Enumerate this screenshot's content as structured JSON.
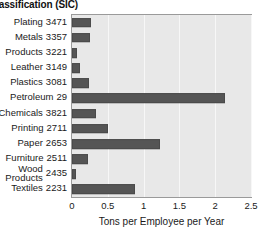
{
  "chart_data": {
    "type": "bar",
    "orientation": "horizontal",
    "title": "lassification (SIC)",
    "xlabel": "Tons per Employee per Year",
    "ylabel": "",
    "xlim": [
      0,
      2.5
    ],
    "xticks": [
      "0",
      "0.5",
      "1",
      "1.5",
      "2",
      "2.5"
    ],
    "xtick_values": [
      0,
      0.5,
      1,
      1.5,
      2,
      2.5
    ],
    "grid": true,
    "legend": "none",
    "bar_color": "#555555",
    "plot_background": "#e8e8e8",
    "categories": [
      "Plating 3471",
      "Metals 3357",
      "Products 3221",
      "Leather 3149",
      "Plastics 3081",
      "Petroleum 29",
      "Chemicals 3821",
      "Printing 2711",
      "Paper 2653",
      "Furniture 2511",
      "Wood Products 2435",
      "Textiles 2231"
    ],
    "category_names": [
      "Plating",
      "Metals",
      "Products",
      "Leather",
      "Plastics",
      "Petroleum",
      "Chemicals",
      "Printing",
      "Paper",
      "Furniture",
      "Wood Products",
      "Textiles"
    ],
    "category_codes": [
      "3471",
      "3357",
      "3221",
      "3149",
      "3081",
      "29",
      "3821",
      "2711",
      "2653",
      "2511",
      "2435",
      "2231"
    ],
    "values": [
      0.27,
      0.25,
      0.07,
      0.11,
      0.24,
      2.14,
      0.34,
      0.5,
      1.23,
      0.22,
      0.06,
      0.88
    ]
  }
}
